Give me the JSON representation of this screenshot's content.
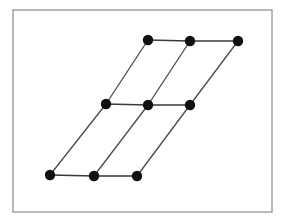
{
  "figure": {
    "canvas": {
      "width": 285,
      "height": 222,
      "background": "#ffffff"
    },
    "frame": {
      "name": "border-frame",
      "x": 13,
      "y": 10,
      "width": 259,
      "height": 202,
      "stroke": "#8a8a8a",
      "stroke_width": 1.2,
      "fill": "none"
    },
    "style": {
      "node_fill": "#111111",
      "node_radius": 5.2,
      "edge_stroke": "#3a3a3a",
      "edge_stroke_width": 1.6,
      "diagonal_stroke": "#4a4a4a",
      "diagonal_stroke_width": 1.3
    },
    "nodes": [
      {
        "id": "n00",
        "label": "top-left",
        "row": 0,
        "col": 0,
        "x": 148,
        "y": 40
      },
      {
        "id": "n01",
        "label": "top-center",
        "row": 0,
        "col": 1,
        "x": 190,
        "y": 41
      },
      {
        "id": "n02",
        "label": "top-right",
        "row": 0,
        "col": 2,
        "x": 238,
        "y": 41
      },
      {
        "id": "n10",
        "label": "mid-left",
        "row": 1,
        "col": 0,
        "x": 106,
        "y": 104
      },
      {
        "id": "n11",
        "label": "mid-center",
        "row": 1,
        "col": 1,
        "x": 148,
        "y": 105
      },
      {
        "id": "n12",
        "label": "mid-right",
        "row": 1,
        "col": 2,
        "x": 190,
        "y": 105
      },
      {
        "id": "n20",
        "label": "bottom-left",
        "row": 2,
        "col": 0,
        "x": 50,
        "y": 175
      },
      {
        "id": "n21",
        "label": "bottom-center",
        "row": 2,
        "col": 1,
        "x": 94,
        "y": 176
      },
      {
        "id": "n22",
        "label": "bottom-right",
        "row": 2,
        "col": 2,
        "x": 137,
        "y": 176
      }
    ],
    "edges": [
      {
        "id": "e-h-top-1",
        "kind": "horizontal",
        "from": "n00",
        "to": "n01"
      },
      {
        "id": "e-h-top-2",
        "kind": "horizontal",
        "from": "n01",
        "to": "n02"
      },
      {
        "id": "e-h-mid-1",
        "kind": "horizontal",
        "from": "n10",
        "to": "n11"
      },
      {
        "id": "e-h-mid-2",
        "kind": "horizontal",
        "from": "n11",
        "to": "n12"
      },
      {
        "id": "e-h-bot-1",
        "kind": "horizontal",
        "from": "n20",
        "to": "n21"
      },
      {
        "id": "e-h-bot-2",
        "kind": "horizontal",
        "from": "n21",
        "to": "n22"
      },
      {
        "id": "e-d-c0-a",
        "kind": "diagonal",
        "from": "n00",
        "to": "n10"
      },
      {
        "id": "e-d-c0-b",
        "kind": "diagonal",
        "from": "n10",
        "to": "n20"
      },
      {
        "id": "e-d-c1-a",
        "kind": "diagonal",
        "from": "n01",
        "to": "n11"
      },
      {
        "id": "e-d-c1-b",
        "kind": "diagonal",
        "from": "n11",
        "to": "n21"
      },
      {
        "id": "e-d-c2-a",
        "kind": "diagonal",
        "from": "n02",
        "to": "n12"
      },
      {
        "id": "e-d-c2-b",
        "kind": "diagonal",
        "from": "n12",
        "to": "n22"
      }
    ]
  }
}
